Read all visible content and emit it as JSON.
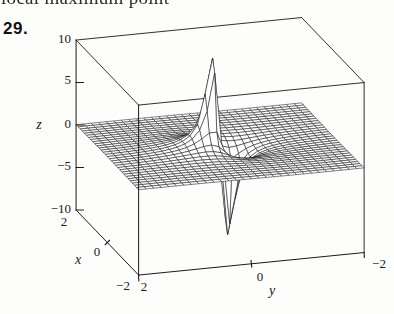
{
  "page": {
    "top_clipped_text": "local maximum point",
    "problem_number": "29."
  },
  "colors": {
    "ink": "#1a1a1a",
    "paper": "#fdfdfc"
  },
  "chart_data": {
    "type": "surface",
    "title": "",
    "axes": {
      "x": {
        "label": "x",
        "range": [
          -2,
          2
        ],
        "tick_labels": [
          "2",
          "0",
          "−2"
        ]
      },
      "y": {
        "label": "y",
        "range": [
          -2,
          2
        ],
        "tick_labels": [
          "2",
          "0",
          "−2"
        ]
      },
      "z": {
        "label": "z",
        "range": [
          -10,
          10
        ],
        "tick_labels": [
          "10",
          "5",
          "0",
          "−5",
          "−10"
        ]
      }
    },
    "surface": {
      "formula": "z ≈ 0.45·y/(x²+y²)^(3/2), clipped to |z| ≤ 10.45",
      "amplitude": 0.45,
      "power": 1.5,
      "clip": 10.45,
      "grid_divisions": 30
    }
  }
}
